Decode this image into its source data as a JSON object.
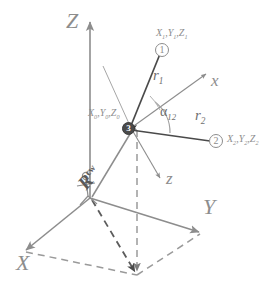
{
  "figure": {
    "colors": {
      "line_gray": "#8d8d8d",
      "line_dark": "#5a5a5a",
      "dashed_gray": "#9a9a9a",
      "node_fill": "#4a4a4a",
      "background": "#ffffff"
    }
  },
  "axes": {
    "global": [
      {
        "name": "axis-label-Z",
        "label": "Z"
      },
      {
        "name": "axis-label-Y",
        "label": "Y"
      },
      {
        "name": "axis-label-X",
        "label": "X"
      }
    ],
    "local": [
      {
        "name": "axis-label-x-local",
        "label": "x"
      },
      {
        "name": "axis-label-z-local",
        "label": "z"
      }
    ]
  },
  "points": {
    "station": {
      "badge": "3",
      "coord_base": "X",
      "coord_sub": "0",
      "coord_label_parts": [
        "X",
        "0",
        "Y",
        "0",
        "Z",
        "0"
      ]
    },
    "target1": {
      "badge": "1",
      "coord_label_parts": [
        "X",
        "1",
        "Y",
        "1",
        "Z",
        "1"
      ]
    },
    "target2": {
      "badge": "2",
      "coord_label_parts": [
        "X",
        "2",
        "Y",
        "2",
        "Z",
        "2"
      ]
    }
  },
  "measurements": {
    "r1": {
      "base": "r",
      "sub": "1"
    },
    "r2": {
      "base": "r",
      "sub": "2"
    },
    "alpha12": {
      "base": "α",
      "sub": "12"
    },
    "R_vector": {
      "base": "R",
      "sup": "cw"
    }
  }
}
